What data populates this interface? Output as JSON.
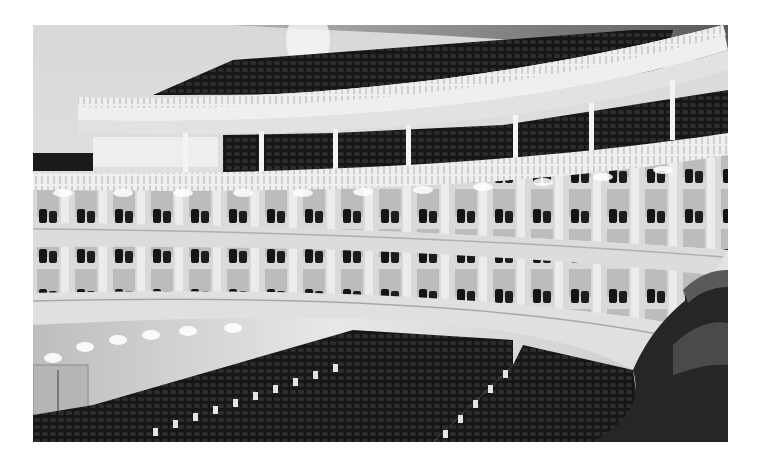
{
  "image": {
    "alt": "Black-and-white photograph of a concert hall interior showing tiered curved balconies with rows of seats, white columns, ornamental balcony fronts, and orchestra-level seating below",
    "subject": "concert hall interior",
    "tone": "grayscale",
    "colors": {
      "background": "#ffffff",
      "wall_light": "#e6e6e6",
      "balcony_white": "#f2f2f2",
      "seat_dark": "#1e1e1e",
      "shadow": "#0e0e0e"
    }
  }
}
